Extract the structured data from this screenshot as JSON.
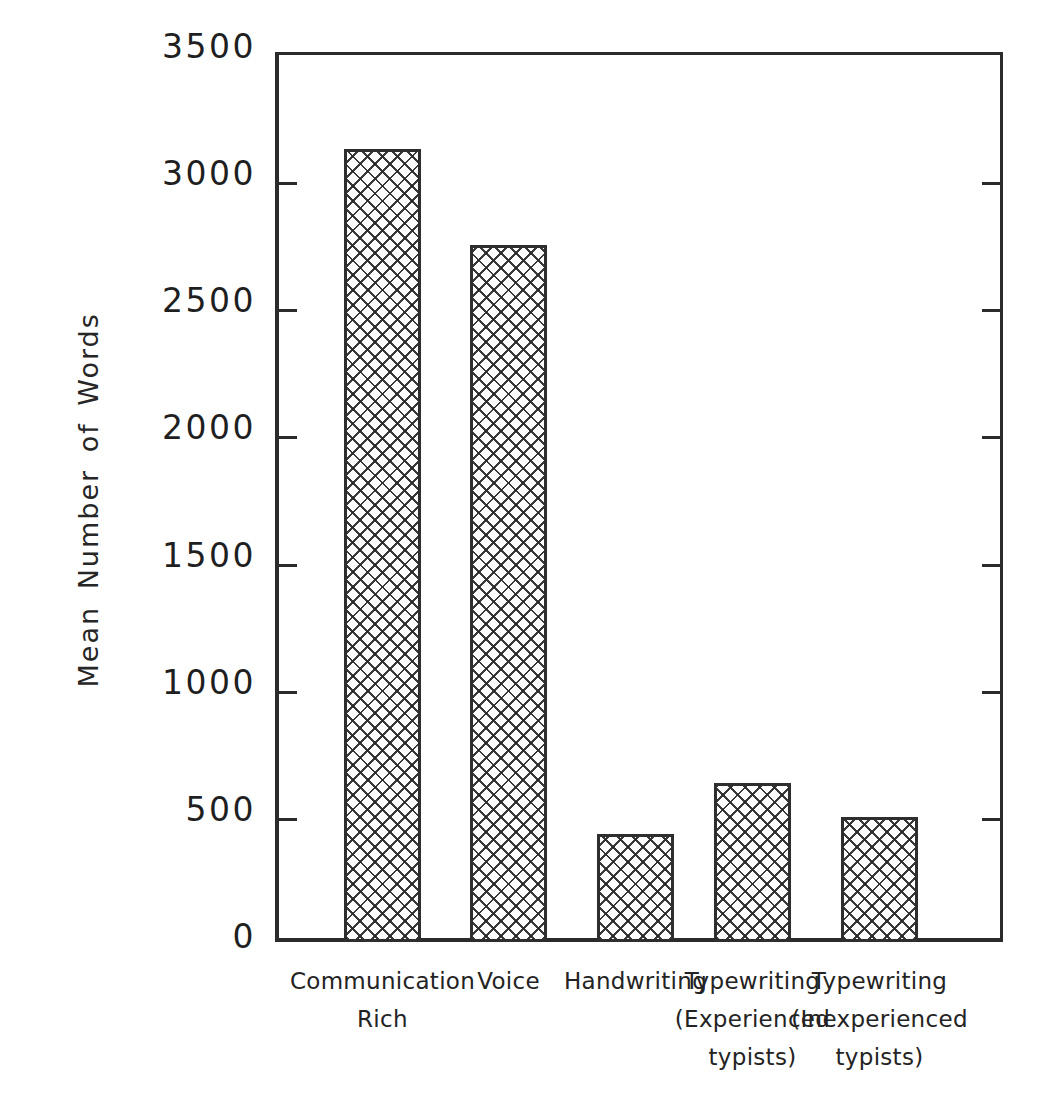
{
  "chart_data": {
    "type": "bar",
    "title": "",
    "xlabel": "",
    "ylabel": "Mean Number of Words",
    "ylim": [
      0,
      3500
    ],
    "ytick_values": [
      0,
      500,
      1000,
      1500,
      2000,
      2500,
      3000,
      3500
    ],
    "ytick_labels": [
      "0",
      "500",
      "1000",
      "1500",
      "2000",
      "2500",
      "3000",
      "3500"
    ],
    "grid": false,
    "legend": null,
    "bar_fill": "crosshatch",
    "bar_edge_color": "#2e2e2e",
    "axis_color": "#2b2b2b",
    "background_color": "#ffffff",
    "categories": [
      "Communication Rich",
      "Voice",
      "Handwriting",
      "Typewriting (Experienced typists)",
      "Typewriting (Inexperienced typists)"
    ],
    "category_label_lines": [
      [
        "Communication",
        "Rich"
      ],
      [
        "Voice"
      ],
      [
        "Handwriting"
      ],
      [
        "Typewriting",
        "(Experienced",
        "typists)"
      ],
      [
        "Typewriting",
        "(Inexperienced",
        "typists)"
      ]
    ],
    "values": [
      3120,
      2740,
      425,
      625,
      490
    ]
  },
  "axes": {
    "y_title": "Mean Number of Words"
  }
}
